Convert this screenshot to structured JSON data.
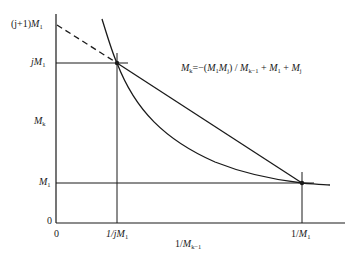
{
  "diagram": {
    "type": "economic-curve",
    "colors": {
      "line": "#1a1a1a",
      "background": "#ffffff"
    },
    "y_axis": {
      "label_main": "M",
      "label_sub": "k",
      "ticks": [
        {
          "pre": "(j+1)",
          "main": "M",
          "sub": "1"
        },
        {
          "pre": "j",
          "main": "M",
          "sub": "1"
        },
        {
          "pre": "",
          "main": "M",
          "sub": "1"
        },
        {
          "pre": "",
          "main": "0",
          "sub": ""
        }
      ]
    },
    "x_axis": {
      "label_pre": "1/",
      "label_main": "M",
      "label_sub": "k−1",
      "ticks": [
        {
          "pre": "",
          "main": "0",
          "sub": ""
        },
        {
          "pre": "1/j",
          "main": "M",
          "sub": "1"
        },
        {
          "pre": "1/",
          "main": "M",
          "sub": "1"
        }
      ]
    },
    "equation": {
      "lhs": "M",
      "lhs_sub": "k",
      "eq": "=−(",
      "t1": "M",
      "t1_sub": "1",
      "t2": "M",
      "t2_sub": "j",
      "mid": ") / ",
      "t3": "M",
      "t3_sub": "k−1",
      "plus1": " + ",
      "t4": "M",
      "t4_sub": "1",
      "plus2": " + ",
      "t5": "M",
      "t5_sub": "j"
    }
  }
}
